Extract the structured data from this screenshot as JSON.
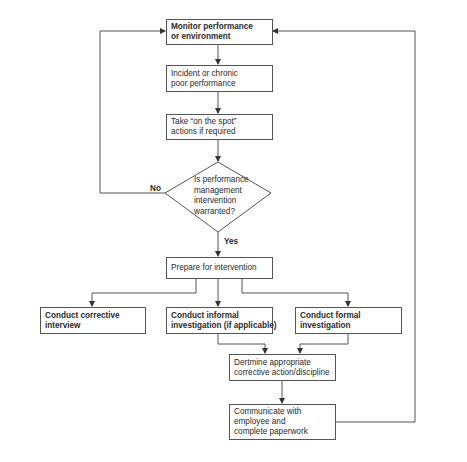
{
  "diagram": {
    "type": "flowchart",
    "nodes": {
      "monitor": {
        "lines": [
          "Monitor performance",
          "or environment"
        ],
        "bold": true
      },
      "incident": {
        "lines": [
          "Incident or chronic",
          "poor performance"
        ]
      },
      "spot": {
        "lines": [
          "Take “on the spot”",
          "actions if required"
        ]
      },
      "decision": {
        "lines": [
          "Is performance",
          "management",
          "intervention",
          "warranted?"
        ]
      },
      "prepare": {
        "lines": [
          "Prepare for intervention"
        ]
      },
      "corrective": {
        "lines": [
          "Conduct corrective",
          "interview"
        ],
        "bold": true
      },
      "informal": {
        "lines": [
          "Conduct informal",
          "investigation (if applicable)"
        ],
        "bold": true
      },
      "formal": {
        "lines": [
          "Conduct formal",
          "investigation"
        ],
        "bold": true
      },
      "determine": {
        "lines": [
          "Dertmine appropriate",
          "corrective action/discipline"
        ]
      },
      "communicate": {
        "lines": [
          "Communicate with",
          "employee and",
          "complete paperwork"
        ]
      }
    },
    "edge_labels": {
      "no": "No",
      "yes": "Yes"
    },
    "edges": [
      [
        "monitor",
        "incident"
      ],
      [
        "incident",
        "spot"
      ],
      [
        "spot",
        "decision"
      ],
      [
        "decision",
        "monitor",
        "No"
      ],
      [
        "decision",
        "prepare",
        "Yes"
      ],
      [
        "prepare",
        "corrective"
      ],
      [
        "prepare",
        "informal"
      ],
      [
        "prepare",
        "formal"
      ],
      [
        "informal",
        "determine"
      ],
      [
        "formal",
        "determine"
      ],
      [
        "determine",
        "communicate"
      ],
      [
        "communicate",
        "monitor"
      ]
    ]
  },
  "colors": {
    "line": "#555555",
    "text": "#2a2a2a",
    "background": "#ffffff"
  }
}
